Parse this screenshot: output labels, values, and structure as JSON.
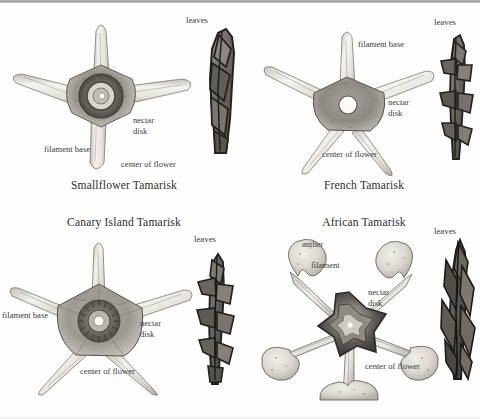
{
  "plate": {
    "type": "botanical-illustration-plate",
    "background_color": "#fdfdfd",
    "ink_color": "#3c3c3c",
    "top_band_color": "#9e9e9e",
    "panel_count": 4
  },
  "panels": [
    {
      "id": "smallflower",
      "title": "Smallflower Tamarisk",
      "flower": {
        "petal_count": 4,
        "center_style": "dark-ring-nectar-disk",
        "disk_color": "#55504c",
        "lobe_color": "#e8e6e0"
      },
      "leaf_label": "leaves",
      "callouts": [
        {
          "name": "nectar-disk",
          "text": "nectar\ndisk"
        },
        {
          "name": "filament-base",
          "text": "filament base"
        },
        {
          "name": "center-of-flower",
          "text": "center of flower"
        }
      ]
    },
    {
      "id": "french",
      "title": "French Tamarisk",
      "flower": {
        "petal_count": 5,
        "center_style": "white-ovary-dot",
        "disk_color": "#8d8a84",
        "lobe_color": "#ececea"
      },
      "leaf_label": "leaves",
      "callouts": [
        {
          "name": "filament-base",
          "text": "filament base"
        },
        {
          "name": "nectar-disk",
          "text": "nectar\ndisk"
        },
        {
          "name": "center-of-flower",
          "text": "center of flower"
        }
      ]
    },
    {
      "id": "canary",
      "title": "Canary Island Tamarisk",
      "flower": {
        "petal_count": 5,
        "center_style": "fringed-dark-disk",
        "disk_color": "#6d6862",
        "lobe_color": "#e4e2dc"
      },
      "leaf_label": "leaves",
      "callouts": [
        {
          "name": "filament-base",
          "text": "filament base"
        },
        {
          "name": "nectar-disk",
          "text": "nectar\ndisk"
        },
        {
          "name": "center-of-flower",
          "text": "center of flower"
        }
      ]
    },
    {
      "id": "african",
      "title": "African Tamarisk",
      "flower": {
        "petal_count": 5,
        "center_style": "dark-star-disk-with-stamens",
        "disk_color": "#5a5550",
        "lobe_color": "#ded9d2",
        "stamen_count": 5,
        "anther_shape": "bilobed-kidney"
      },
      "leaf_label": "leaves",
      "callouts": [
        {
          "name": "anther",
          "text": "anther"
        },
        {
          "name": "filament",
          "text": "filament"
        },
        {
          "name": "nectar-disk",
          "text": "nectar\ndisk"
        },
        {
          "name": "center-of-flower",
          "text": "center of flower"
        }
      ]
    }
  ]
}
